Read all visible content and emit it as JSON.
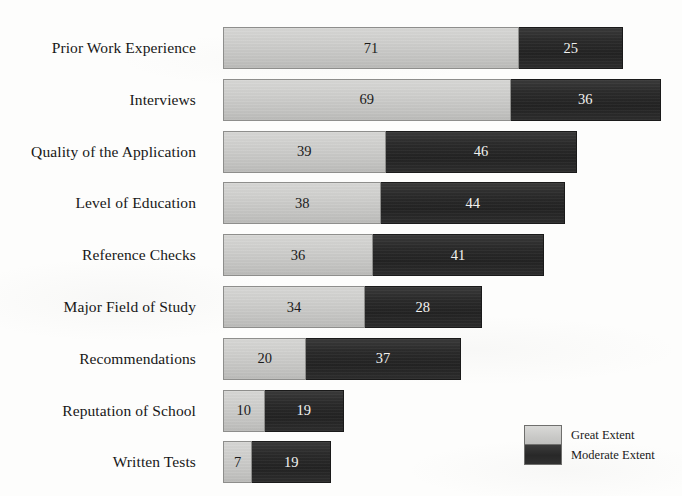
{
  "chart_data": {
    "type": "bar",
    "orientation": "horizontal",
    "stacked": true,
    "title": "",
    "subtitle": "",
    "xlabel": "",
    "ylabel": "",
    "grid": false,
    "legend_position": "bottom-right",
    "categories": [
      "Prior Work Experience",
      "Interviews",
      "Quality of the Application",
      "Level of Education",
      "Reference Checks",
      "Major Field of Study",
      "Recommendations",
      "Reputation of School",
      "Written Tests"
    ],
    "series": [
      {
        "name": "Great Extent",
        "color": "#cfcfcd",
        "values": [
          71,
          69,
          39,
          38,
          36,
          34,
          20,
          10,
          7
        ]
      },
      {
        "name": "Moderate Extent",
        "color": "#2b2b2b",
        "values": [
          25,
          36,
          46,
          44,
          41,
          28,
          37,
          19,
          19
        ]
      }
    ],
    "xlim": [
      0,
      107
    ],
    "tick_labels": [],
    "annotations": []
  },
  "legend": {
    "entries": [
      {
        "label": "Great Extent",
        "swatch": "legend-swatch-great"
      },
      {
        "label": "Moderate Extent",
        "swatch": "legend-swatch-moderate"
      }
    ]
  }
}
